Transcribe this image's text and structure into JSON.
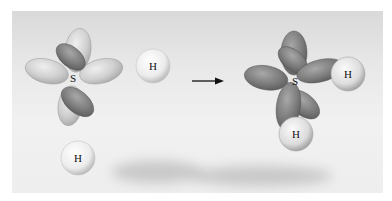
{
  "figure": {
    "left_group": {
      "central_atom_label": "S",
      "hydrogen_labels": [
        "H",
        "H"
      ]
    },
    "arrow": "→",
    "right_group": {
      "central_atom_label": "S",
      "hydrogen_labels": [
        "H",
        "H"
      ]
    },
    "colors": {
      "background": "#ececec",
      "lobe_light": "#c9c9c9",
      "lobe_dark": "#7a7a7a",
      "hydrogen": "#f4f4f4"
    }
  }
}
